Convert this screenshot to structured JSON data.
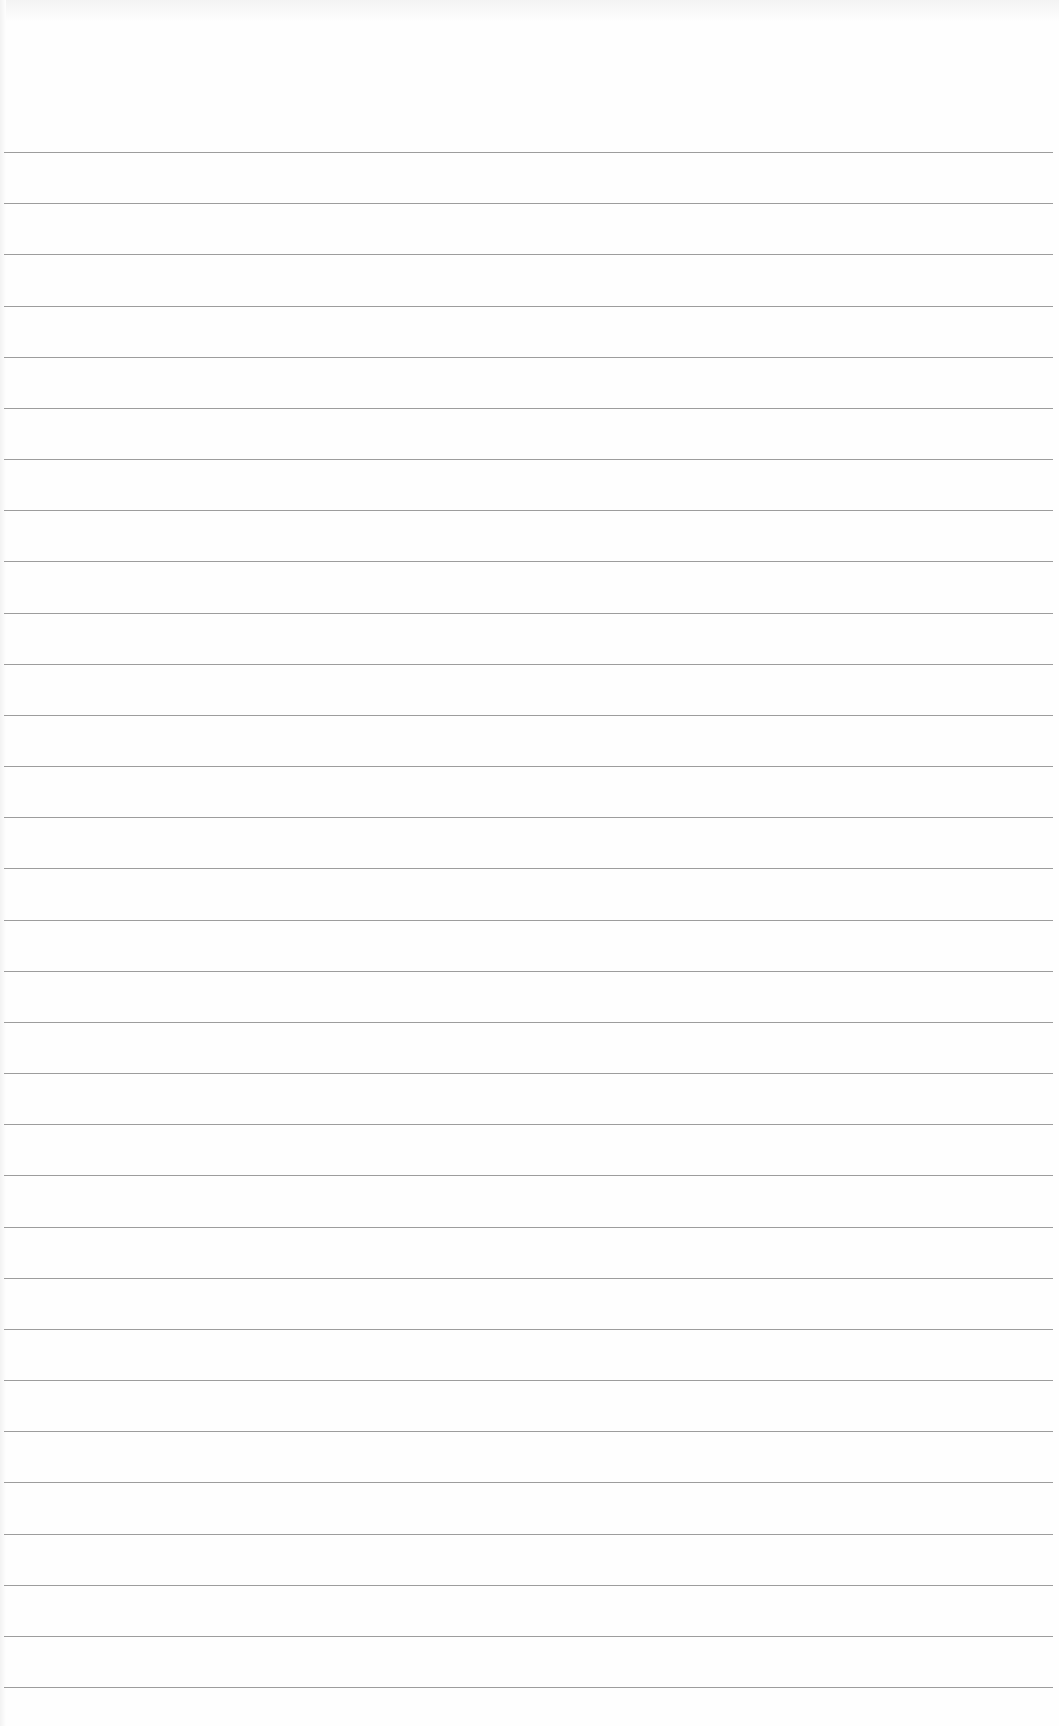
{
  "paper": {
    "type": "ruled notepad sheet",
    "background_color": "#fefefe",
    "rule_color": "#8c8c8c",
    "rule_count": 31,
    "first_rule_y": 152,
    "rule_spacing": 51.17
  }
}
